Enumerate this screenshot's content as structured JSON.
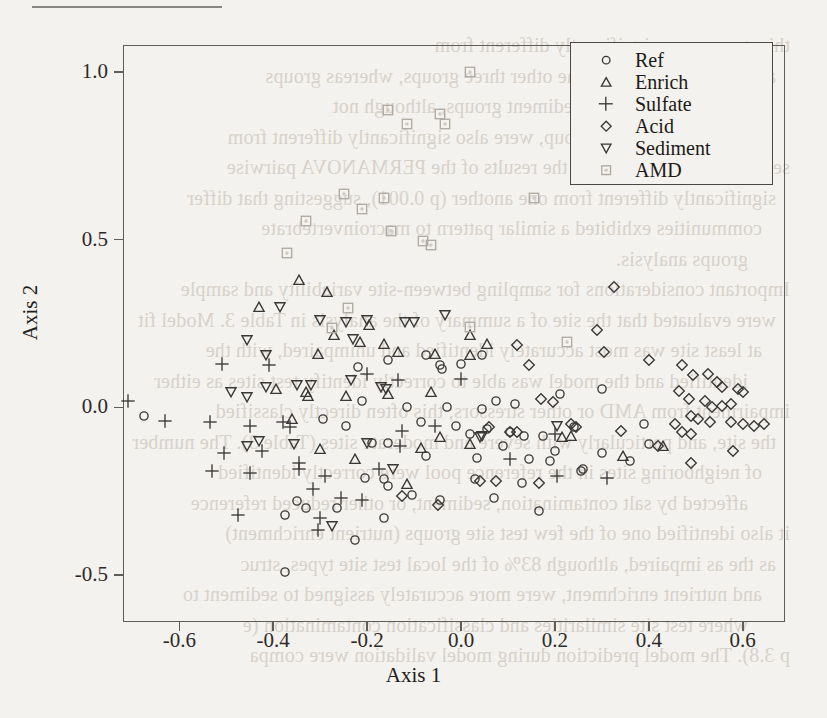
{
  "page": {
    "background_color": "#f4f2ee",
    "ink_color": "#2c2a28"
  },
  "bleed_through_lines": [
    "this group were significantly different from",
    "and also different from the other three groups, whereas groups",
    "The sulfate, acid, and sediment groups, although not",
    "from the reference group, were also significantly different from",
    "sediment groups, based on the results of the PERMANOVA pairwise",
    "significantly different from one another (p 0.001), suggesting that differ",
    "communities exhibited a similar pattern to macroinvertebrate",
    "groups analysis.",
    "Important considerations for sampling between-site variability and sample",
    "were evaluated that the site of a summary of the analysis in Table 3. Model fit",
    "at least site was most accurately identified and unimpaired, with the",
    "identified and the model was able to correctly identify test sites as either",
    "impairment from AMD or other stressors; this often directly classified",
    "the site, and particularly with severe and moderate sites (Table 3). The number",
    "of neighboring sites in the reference pool were correctly identified",
    "affected by salt contamination, sediment, or other reduced reference",
    "it also identified one of the few test site groups (nutrient enrichment)",
    "as the as impaired, although 83% of the local test site types, struc",
    "and nutrient enrichment, were more accurately assigned to sediment to",
    "where test site similarities and classification contamination (e",
    "p 3.8). The model prediction during model validation were compa"
  ],
  "chart_data": {
    "type": "scatter",
    "title": "",
    "xlabel": "Axis 1",
    "ylabel": "Axis 2",
    "xlim": [
      -0.72,
      0.69
    ],
    "ylim": [
      -0.64,
      1.08
    ],
    "xticks": [
      -0.6,
      -0.4,
      -0.2,
      0.0,
      0.2,
      0.4,
      0.6
    ],
    "xticklabels": [
      "-0.6",
      "-0.4",
      "-0.2",
      "0.0",
      "0.2",
      "0.4",
      "0.6"
    ],
    "yticks": [
      1.0,
      0.5,
      0.0,
      -0.5
    ],
    "yticklabels": [
      "1.0",
      "0.5",
      "0.0",
      "-0.5"
    ],
    "grid": false,
    "legend_position": "top-right",
    "series": [
      {
        "name": "Ref",
        "marker": "circle",
        "color": "#3a3836",
        "points": [
          [
            -0.675,
            -0.025
          ],
          [
            -0.085,
            -0.045
          ],
          [
            -0.01,
            -0.055
          ],
          [
            0.055,
            -0.065
          ],
          [
            0.02,
            -0.08
          ],
          [
            0.105,
            -0.075
          ],
          [
            0.135,
            -0.085
          ],
          [
            0.175,
            -0.085
          ],
          [
            -0.19,
            -0.105
          ],
          [
            -0.155,
            -0.105
          ],
          [
            0.09,
            -0.115
          ],
          [
            0.2,
            -0.13
          ],
          [
            -0.075,
            -0.145
          ],
          [
            0.035,
            -0.15
          ],
          [
            0.145,
            -0.155
          ],
          [
            0.19,
            -0.16
          ],
          [
            -0.245,
            -0.055
          ],
          [
            -0.295,
            -0.035
          ],
          [
            -0.22,
            0.12
          ],
          [
            -0.155,
            0.14
          ],
          [
            -0.075,
            0.155
          ],
          [
            -0.045,
            0.125
          ],
          [
            -0.04,
            0.115
          ],
          [
            0.075,
            0.02
          ],
          [
            -0.205,
            -0.21
          ],
          [
            -0.165,
            -0.215
          ],
          [
            -0.155,
            -0.235
          ],
          [
            0.03,
            -0.215
          ],
          [
            0.13,
            -0.225
          ],
          [
            0.255,
            -0.19
          ],
          [
            -0.105,
            -0.26
          ],
          [
            -0.045,
            -0.275
          ],
          [
            0.07,
            -0.27
          ],
          [
            -0.35,
            -0.28
          ],
          [
            -0.33,
            -0.3
          ],
          [
            -0.375,
            -0.32
          ],
          [
            -0.265,
            -0.3
          ],
          [
            -0.165,
            -0.33
          ],
          [
            -0.225,
            -0.395
          ],
          [
            -0.375,
            -0.49
          ],
          [
            0.165,
            -0.31
          ],
          [
            0.26,
            -0.185
          ],
          [
            0.36,
            -0.16
          ],
          [
            0.4,
            -0.11
          ],
          [
            0.39,
            -0.05
          ],
          [
            0.3,
            -0.135
          ],
          [
            0.24,
            -0.06
          ],
          [
            0.115,
            0.01
          ],
          [
            0.045,
            -0.005
          ],
          [
            -0.03,
            0.0
          ],
          [
            0.21,
            0.04
          ],
          [
            0.3,
            0.055
          ],
          [
            -0.115,
            0.0
          ],
          [
            -0.21,
            0.02
          ],
          [
            0.0,
            0.13
          ],
          [
            0.045,
            0.155
          ]
        ]
      },
      {
        "name": "Enrich",
        "marker": "triangle-up",
        "color": "#3a3836",
        "points": [
          [
            -0.43,
            0.3
          ],
          [
            -0.345,
            0.38
          ],
          [
            -0.285,
            0.345
          ],
          [
            -0.195,
            0.245
          ],
          [
            -0.27,
            0.215
          ],
          [
            -0.215,
            0.195
          ],
          [
            -0.305,
            0.16
          ],
          [
            -0.165,
            0.19
          ],
          [
            -0.135,
            0.165
          ],
          [
            -0.055,
            0.16
          ],
          [
            0.02,
            0.155
          ],
          [
            -0.395,
            0.055
          ],
          [
            -0.33,
            0.045
          ],
          [
            -0.325,
            0.035
          ],
          [
            -0.245,
            0.035
          ],
          [
            -0.155,
            0.04
          ],
          [
            -0.065,
            0.045
          ],
          [
            -0.36,
            -0.035
          ],
          [
            -0.045,
            -0.09
          ],
          [
            0.02,
            -0.11
          ],
          [
            0.235,
            -0.085
          ],
          [
            0.345,
            -0.145
          ],
          [
            0.43,
            -0.115
          ],
          [
            -0.225,
            -0.155
          ],
          [
            -0.115,
            -0.23
          ],
          [
            0.02,
            0.215
          ],
          [
            0.055,
            0.19
          ],
          [
            -0.085,
            -0.12
          ],
          [
            0.215,
            -0.09
          ],
          [
            -0.3,
            -0.125
          ]
        ]
      },
      {
        "name": "Sulfate",
        "marker": "plus",
        "color": "#6a6762",
        "points": [
          [
            -0.71,
            0.02
          ],
          [
            -0.63,
            -0.04
          ],
          [
            -0.535,
            -0.045
          ],
          [
            -0.45,
            -0.055
          ],
          [
            -0.38,
            -0.045
          ],
          [
            -0.365,
            -0.06
          ],
          [
            -0.505,
            -0.135
          ],
          [
            -0.425,
            -0.13
          ],
          [
            -0.53,
            -0.19
          ],
          [
            -0.45,
            -0.195
          ],
          [
            -0.345,
            -0.165
          ],
          [
            -0.345,
            -0.185
          ],
          [
            -0.29,
            -0.205
          ],
          [
            -0.315,
            -0.245
          ],
          [
            -0.255,
            -0.27
          ],
          [
            -0.21,
            -0.275
          ],
          [
            -0.175,
            -0.185
          ],
          [
            -0.13,
            -0.115
          ],
          [
            -0.125,
            -0.07
          ],
          [
            -0.055,
            -0.055
          ],
          [
            -0.2,
            0.1
          ],
          [
            -0.135,
            0.08
          ],
          [
            -0.41,
            0.125
          ],
          [
            -0.51,
            0.13
          ],
          [
            0.0,
            0.085
          ],
          [
            0.205,
            -0.205
          ],
          [
            0.31,
            -0.21
          ],
          [
            0.2,
            -0.08
          ],
          [
            -0.475,
            -0.32
          ],
          [
            -0.3,
            -0.33
          ],
          [
            -0.305,
            -0.365
          ],
          [
            0.105,
            -0.155
          ]
        ]
      },
      {
        "name": "Acid",
        "marker": "diamond",
        "color": "#3a3836",
        "points": [
          [
            0.325,
            0.36
          ],
          [
            0.29,
            0.23
          ],
          [
            0.305,
            0.165
          ],
          [
            0.4,
            0.14
          ],
          [
            0.47,
            0.125
          ],
          [
            0.495,
            0.095
          ],
          [
            0.525,
            0.1
          ],
          [
            0.545,
            0.075
          ],
          [
            0.555,
            0.06
          ],
          [
            0.59,
            0.055
          ],
          [
            0.6,
            0.045
          ],
          [
            0.465,
            0.05
          ],
          [
            0.485,
            0.025
          ],
          [
            0.52,
            0.02
          ],
          [
            0.535,
            0.0
          ],
          [
            0.555,
            0.005
          ],
          [
            0.575,
            0.01
          ],
          [
            0.49,
            -0.025
          ],
          [
            0.505,
            -0.035
          ],
          [
            0.53,
            -0.045
          ],
          [
            0.455,
            -0.05
          ],
          [
            0.47,
            -0.075
          ],
          [
            0.49,
            -0.08
          ],
          [
            0.575,
            -0.045
          ],
          [
            0.6,
            -0.05
          ],
          [
            0.625,
            -0.055
          ],
          [
            0.645,
            -0.05
          ],
          [
            0.58,
            -0.13
          ],
          [
            0.49,
            -0.165
          ],
          [
            0.42,
            -0.115
          ],
          [
            0.12,
            0.185
          ],
          [
            0.145,
            0.125
          ],
          [
            0.17,
            0.025
          ],
          [
            0.195,
            0.015
          ],
          [
            0.06,
            -0.06
          ],
          [
            0.105,
            -0.075
          ],
          [
            0.12,
            -0.075
          ],
          [
            0.04,
            -0.22
          ],
          [
            0.075,
            -0.22
          ],
          [
            0.165,
            -0.225
          ],
          [
            -0.05,
            -0.29
          ],
          [
            0.235,
            -0.05
          ],
          [
            0.245,
            -0.06
          ],
          [
            0.34,
            -0.07
          ],
          [
            -0.125,
            -0.265
          ]
        ]
      },
      {
        "name": "Sediment",
        "marker": "triangle-down",
        "color": "#3a3836",
        "points": [
          [
            -0.385,
            0.3
          ],
          [
            -0.455,
            0.2
          ],
          [
            -0.415,
            0.155
          ],
          [
            -0.3,
            0.26
          ],
          [
            -0.245,
            0.255
          ],
          [
            -0.23,
            0.205
          ],
          [
            -0.2,
            0.26
          ],
          [
            -0.415,
            0.06
          ],
          [
            -0.35,
            0.065
          ],
          [
            -0.32,
            0.065
          ],
          [
            -0.49,
            0.045
          ],
          [
            -0.455,
            0.03
          ],
          [
            -0.235,
            0.08
          ],
          [
            -0.17,
            0.06
          ],
          [
            -0.16,
            0.055
          ],
          [
            -0.1,
            0.255
          ],
          [
            -0.145,
            -0.185
          ],
          [
            -0.275,
            -0.355
          ],
          [
            -0.2,
            -0.105
          ],
          [
            -0.355,
            -0.11
          ],
          [
            0.045,
            -0.085
          ],
          [
            0.04,
            -0.09
          ],
          [
            0.205,
            -0.055
          ],
          [
            -0.035,
            0.275
          ],
          [
            -0.12,
            0.255
          ],
          [
            -0.43,
            -0.1
          ],
          [
            -0.455,
            -0.115
          ]
        ]
      },
      {
        "name": "AMD",
        "marker": "square-dot",
        "color": "#b0aaa2",
        "points": [
          [
            0.02,
            1.0
          ],
          [
            -0.155,
            0.885
          ],
          [
            -0.115,
            0.845
          ],
          [
            -0.045,
            0.875
          ],
          [
            -0.035,
            0.845
          ],
          [
            -0.25,
            0.635
          ],
          [
            -0.21,
            0.59
          ],
          [
            -0.165,
            0.625
          ],
          [
            -0.33,
            0.555
          ],
          [
            -0.37,
            0.46
          ],
          [
            -0.15,
            0.525
          ],
          [
            0.155,
            0.625
          ],
          [
            -0.24,
            0.295
          ],
          [
            -0.08,
            0.495
          ],
          [
            -0.065,
            0.485
          ],
          [
            -0.275,
            0.235
          ],
          [
            0.02,
            0.24
          ],
          [
            0.225,
            0.195
          ]
        ]
      }
    ]
  },
  "legend": {
    "items": [
      {
        "label": "Ref",
        "marker": "circle"
      },
      {
        "label": "Enrich",
        "marker": "triangle-up"
      },
      {
        "label": "Sulfate",
        "marker": "plus"
      },
      {
        "label": "Acid",
        "marker": "diamond"
      },
      {
        "label": "Sediment",
        "marker": "triangle-down"
      },
      {
        "label": "AMD",
        "marker": "square-dot"
      }
    ]
  }
}
